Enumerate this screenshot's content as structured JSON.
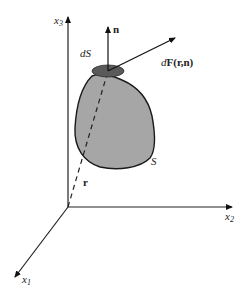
{
  "diagram": {
    "type": "vector-field-on-surface",
    "axes": {
      "x1": {
        "label": "x",
        "subscript": "1"
      },
      "x2": {
        "label": "x",
        "subscript": "2"
      },
      "x3": {
        "label": "x",
        "subscript": "3"
      }
    },
    "surface": {
      "label": "S",
      "fill": "#a6a6a6",
      "stroke": "#1a1a1a"
    },
    "surface_element": {
      "label": "dS",
      "fill": "#5a5a5a"
    },
    "normal_vector": {
      "label": "n"
    },
    "force_vector": {
      "label_prefix": "d",
      "label_bold": "F(r,n)"
    },
    "position_vector": {
      "label": "r",
      "style": "dashed"
    }
  }
}
